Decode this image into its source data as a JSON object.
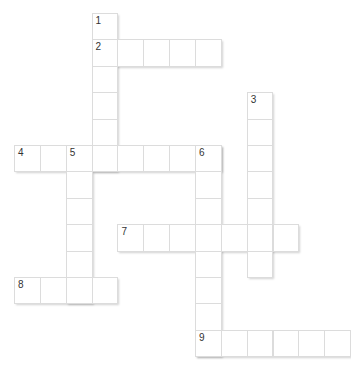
{
  "puzzle": {
    "type": "crossword",
    "cell_size": 26,
    "origin": {
      "x": 14,
      "y": 13
    },
    "col_step": 25.85,
    "row_step": 26.4,
    "words": [
      {
        "number": "1",
        "direction": "down",
        "row": 0,
        "col": 3,
        "length": 6
      },
      {
        "number": "2",
        "direction": "across",
        "row": 1,
        "col": 3,
        "length": 5
      },
      {
        "number": "3",
        "direction": "down",
        "row": 3,
        "col": 9,
        "length": 7
      },
      {
        "number": "4",
        "direction": "across",
        "row": 5,
        "col": 0,
        "length": 8
      },
      {
        "number": "5",
        "direction": "down",
        "row": 5,
        "col": 2,
        "length": 6
      },
      {
        "number": "6",
        "direction": "down",
        "row": 5,
        "col": 7,
        "length": 8
      },
      {
        "number": "7",
        "direction": "across",
        "row": 8,
        "col": 4,
        "length": 7
      },
      {
        "number": "8",
        "direction": "across",
        "row": 10,
        "col": 0,
        "length": 4
      },
      {
        "number": "9",
        "direction": "across",
        "row": 12,
        "col": 7,
        "length": 6
      }
    ]
  },
  "colors": {
    "cell_border": "#dcdcdc",
    "number_text": "#333333",
    "background": "#ffffff"
  }
}
